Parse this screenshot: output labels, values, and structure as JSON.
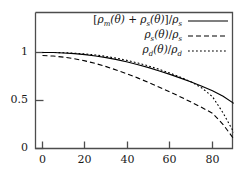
{
  "chart_data": {
    "type": "line",
    "title": "",
    "xlabel": "",
    "ylabel": "",
    "xlim": [
      0,
      90
    ],
    "ylim": [
      0,
      1.42
    ],
    "grid": false,
    "legend_position": "top-right-inside",
    "xticks": [
      0,
      20,
      40,
      60,
      80
    ],
    "xtick_labels": [
      "0",
      "20",
      "40",
      "60",
      "80"
    ],
    "yticks": [
      0,
      0.5,
      1
    ],
    "ytick_labels": [
      "0",
      "0.5",
      "1"
    ],
    "x": [
      0,
      5,
      10,
      15,
      20,
      25,
      30,
      35,
      40,
      45,
      50,
      55,
      60,
      65,
      70,
      75,
      80,
      85,
      90
    ],
    "series": [
      {
        "name": "[ρm(θ) + ρs(θ)]/ρs",
        "style": "solid",
        "color": "#000000",
        "values": [
          1.0,
          1.0,
          0.995,
          0.988,
          0.978,
          0.964,
          0.947,
          0.926,
          0.901,
          0.873,
          0.842,
          0.808,
          0.772,
          0.733,
          0.693,
          0.649,
          0.602,
          0.545,
          0.47
        ]
      },
      {
        "name": "ρs(θ)/ρs",
        "style": "dashed",
        "color": "#000000",
        "values": [
          0.968,
          0.963,
          0.952,
          0.935,
          0.913,
          0.885,
          0.853,
          0.816,
          0.776,
          0.733,
          0.687,
          0.639,
          0.589,
          0.537,
          0.483,
          0.427,
          0.367,
          0.25,
          0.1
        ]
      },
      {
        "name": "ρd(θ)/ρd",
        "style": "dotted",
        "color": "#000000",
        "values": [
          1.0,
          1.0,
          0.998,
          0.993,
          0.985,
          0.974,
          0.959,
          0.94,
          0.917,
          0.89,
          0.859,
          0.824,
          0.785,
          0.742,
          0.694,
          0.63,
          0.54,
          0.37,
          0.17
        ]
      }
    ]
  },
  "legend": {
    "entries": [
      {
        "label": "[ρm(θ) + ρs(θ)]/ρs",
        "style": "solid"
      },
      {
        "label": "ρs(θ)/ρs",
        "style": "dashed"
      },
      {
        "label": "ρd(θ)/ρd",
        "style": "dotted"
      }
    ]
  },
  "axes": {
    "frame_color": "#4d4d4d",
    "curve_color": "#000000"
  }
}
